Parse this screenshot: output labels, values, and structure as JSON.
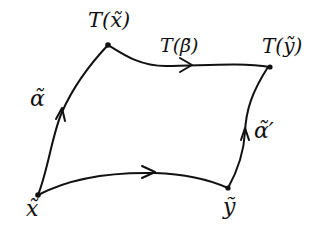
{
  "diagram": {
    "type": "commutative-square",
    "colors": {
      "stroke": "#111111",
      "background": "#ffffff"
    },
    "nodes": [
      {
        "id": "x",
        "label": "x̃",
        "position": "bottom-left"
      },
      {
        "id": "y",
        "label": "ỹ",
        "position": "bottom-right"
      },
      {
        "id": "Tx",
        "label": "T(x̃)",
        "position": "top-left"
      },
      {
        "id": "Ty",
        "label": "T(ỹ)",
        "position": "top-right"
      }
    ],
    "edges": [
      {
        "from": "x",
        "to": "Tx",
        "label": "α̃",
        "arrow": "up"
      },
      {
        "from": "y",
        "to": "Ty",
        "label": "α̃′",
        "arrow": "up"
      },
      {
        "from": "x",
        "to": "y",
        "label": "",
        "arrow": "right"
      },
      {
        "from": "Tx",
        "to": "Ty",
        "label": "T(β̃)",
        "arrow": "right"
      }
    ]
  },
  "labels": {
    "Tx": "T(x̃)",
    "Tbeta": "T(β̃)",
    "Ty": "T(ỹ)",
    "alpha": "α̃",
    "alpha_prime": "α̃′",
    "x": "x̃",
    "y": "ỹ"
  }
}
